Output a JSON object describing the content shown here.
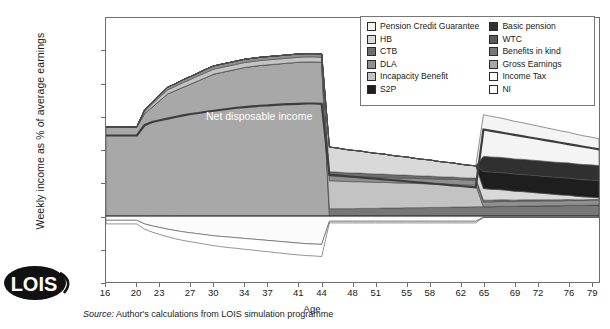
{
  "axes": {
    "ylabel": "Weekly income as % of average earnings",
    "xlabel": "Age",
    "yticks": [
      60,
      50,
      40,
      30,
      20,
      10,
      0,
      -10,
      -20
    ],
    "xticks": [
      16,
      20,
      23,
      27,
      30,
      34,
      37,
      41,
      44,
      48,
      51,
      55,
      58,
      62,
      65,
      69,
      72,
      76,
      79
    ]
  },
  "annotation": {
    "net_disposable_income": "Net disposable income"
  },
  "source": {
    "prefix": "Source:",
    "text": "Author's calculations from LOIS simulation programme"
  },
  "logo": {
    "text": "LOIS"
  },
  "legend": {
    "left": [
      {
        "label": "Pension Credit Guarantee",
        "color": "#f4f4f4"
      },
      {
        "label": "HB",
        "color": "#d9d9d9"
      },
      {
        "label": "CTB",
        "color": "#6e6e6e"
      },
      {
        "label": "DLA",
        "color": "#8f8f8f"
      },
      {
        "label": "Incapacity Benefit",
        "color": "#c3c3c3"
      },
      {
        "label": "S2P",
        "color": "#1e1e1e"
      }
    ],
    "right": [
      {
        "label": "Basic pension",
        "color": "#303030"
      },
      {
        "label": "WTC",
        "color": "#5a5a5a"
      },
      {
        "label": "Benefits in kind",
        "color": "#777777"
      },
      {
        "label": "Gross Earnings",
        "color": "#a8a8a8"
      },
      {
        "label": "Income Tax",
        "color": "#fbfbfb"
      },
      {
        "label": "NI",
        "color": "#ffffff"
      }
    ]
  },
  "chart_data": {
    "type": "area",
    "title": "",
    "xlabel": "Age",
    "ylabel": "Weekly income as % of average earnings",
    "xlim": [
      16,
      80
    ],
    "ylim": [
      -20,
      60
    ],
    "grid": false,
    "legend_position": "top-right",
    "x": [
      16,
      17,
      18,
      19,
      20,
      21,
      22,
      23,
      24,
      25,
      26,
      27,
      28,
      29,
      30,
      31,
      32,
      33,
      34,
      35,
      36,
      37,
      38,
      39,
      40,
      41,
      42,
      43,
      44,
      45,
      46,
      47,
      48,
      49,
      50,
      51,
      52,
      53,
      54,
      55,
      56,
      57,
      58,
      59,
      60,
      61,
      62,
      63,
      64,
      65,
      66,
      67,
      68,
      69,
      70,
      71,
      72,
      73,
      74,
      75,
      76,
      77,
      78,
      79,
      80
    ],
    "series": [
      {
        "name": "Gross Earnings",
        "color": "#a8a8a8",
        "values": [
          27,
          27,
          27,
          27,
          27,
          31,
          33,
          35,
          37,
          38,
          39,
          40,
          41,
          42,
          43,
          43.5,
          44,
          44.5,
          45,
          45.3,
          45.6,
          45.8,
          46,
          46.2,
          46.4,
          46.6,
          46.7,
          46.7,
          46.6,
          0,
          0,
          0,
          0,
          0,
          0,
          0,
          0,
          0,
          0,
          0,
          0,
          0,
          0,
          0,
          0,
          0,
          0,
          0,
          0,
          0,
          0,
          0,
          0,
          0,
          0,
          0,
          0,
          0,
          0,
          0,
          0,
          0,
          0,
          0,
          0
        ]
      },
      {
        "name": "Benefits in kind",
        "color": "#777777",
        "values": [
          0,
          0,
          0,
          0,
          0,
          0,
          0,
          0,
          0,
          0,
          0,
          0,
          0,
          0,
          0,
          0,
          0,
          0,
          0,
          0,
          0,
          0,
          0,
          0,
          0,
          0,
          0,
          0,
          0,
          2.2,
          2.2,
          2.2,
          2.2,
          2.3,
          2.3,
          2.3,
          2.4,
          2.4,
          2.4,
          2.5,
          2.5,
          2.5,
          2.6,
          2.6,
          2.6,
          2.7,
          2.7,
          2.7,
          2.8,
          2.8,
          2.8,
          2.9,
          2.9,
          2.9,
          3,
          3,
          3,
          3.1,
          3.1,
          3.1,
          3.2,
          3.2,
          3.2,
          3.3,
          3.3
        ]
      },
      {
        "name": "Incapacity Benefit",
        "color": "#c3c3c3",
        "values": [
          0,
          0,
          0,
          0,
          0,
          0.6,
          0.9,
          1.1,
          1.2,
          1.3,
          1.4,
          1.4,
          1.5,
          1.5,
          1.5,
          1.5,
          1.5,
          1.5,
          1.5,
          1.5,
          1.5,
          1.5,
          1.5,
          1.5,
          1.5,
          1.5,
          1.5,
          1.5,
          1.5,
          8.5,
          8.4,
          8.3,
          8.2,
          8.1,
          8,
          7.9,
          7.8,
          7.7,
          7.6,
          7.5,
          7.4,
          7.3,
          7.2,
          7.1,
          7,
          6.9,
          6.8,
          6.7,
          6.6,
          0,
          0,
          0,
          0,
          0,
          0,
          0,
          0,
          0,
          0,
          0,
          0,
          0,
          0,
          0,
          0
        ]
      },
      {
        "name": "DLA",
        "color": "#8f8f8f",
        "values": [
          0,
          0,
          0,
          0,
          0,
          0.5,
          0.6,
          0.7,
          0.8,
          0.8,
          0.9,
          0.9,
          0.9,
          1,
          1,
          1,
          1,
          1,
          1,
          1,
          1,
          1,
          1,
          1,
          1,
          1,
          1,
          1,
          1,
          1.5,
          1.5,
          1.5,
          1.5,
          1.5,
          1.5,
          1.5,
          1.5,
          1.5,
          1.5,
          1.5,
          1.5,
          1.5,
          1.5,
          1.5,
          1.5,
          1.5,
          1.5,
          1.5,
          1.5,
          1.5,
          1.5,
          1.5,
          1.5,
          1.5,
          1.5,
          1.5,
          1.5,
          1.5,
          1.5,
          1.5,
          1.5,
          1.5,
          1.5,
          1.5,
          1.5
        ]
      },
      {
        "name": "CTB",
        "color": "#6e6e6e",
        "values": [
          0,
          0,
          0,
          0,
          0,
          0,
          0,
          0,
          0,
          0,
          0,
          0,
          0,
          0,
          0,
          0,
          0,
          0,
          0,
          0,
          0,
          0,
          0,
          0,
          0,
          0,
          0,
          0,
          0,
          1.2,
          1.2,
          1.1,
          1.1,
          1.1,
          1,
          1,
          1,
          0.9,
          0.9,
          0.9,
          0.8,
          0.8,
          0.8,
          0.7,
          0.7,
          0.7,
          0.6,
          0.6,
          0.6,
          0.5,
          0.5,
          0.5,
          0.5,
          0.4,
          0.4,
          0.4,
          0.4,
          0.3,
          0.3,
          0.3,
          0.3,
          0.2,
          0.2,
          0.2,
          0.2
        ]
      },
      {
        "name": "HB",
        "color": "#d9d9d9",
        "values": [
          0,
          0,
          0,
          0,
          0,
          0,
          0,
          0,
          0,
          0,
          0,
          0,
          0,
          0,
          0,
          0,
          0,
          0,
          0,
          0,
          0,
          0,
          0,
          0,
          0,
          0,
          0,
          0,
          0,
          7.5,
          7.3,
          7.1,
          6.9,
          6.7,
          6.5,
          6.3,
          6.1,
          5.9,
          5.7,
          5.5,
          5.3,
          5.1,
          4.9,
          4.7,
          4.5,
          4.3,
          4.1,
          3.9,
          3.7,
          3.5,
          3.3,
          3.1,
          2.9,
          2.7,
          2.5,
          2.3,
          2.1,
          1.9,
          1.7,
          1.5,
          1.3,
          1.1,
          0.9,
          0.7,
          0.5
        ]
      },
      {
        "name": "S2P",
        "color": "#1e1e1e",
        "values": [
          0,
          0,
          0,
          0,
          0,
          0,
          0,
          0,
          0,
          0,
          0,
          0,
          0,
          0,
          0,
          0,
          0,
          0,
          0,
          0,
          0,
          0,
          0,
          0,
          0,
          0,
          0,
          0,
          0,
          0,
          0,
          0,
          0,
          0,
          0,
          0,
          0,
          0,
          0,
          0,
          0,
          0,
          0,
          0,
          0,
          0,
          0,
          0,
          0,
          5.2,
          5.2,
          5.2,
          5.2,
          5.2,
          5.2,
          5.2,
          5.2,
          5.2,
          5.2,
          5.2,
          5.2,
          5.2,
          5.2,
          5.2,
          5.2
        ]
      },
      {
        "name": "Basic pension",
        "color": "#303030",
        "values": [
          0,
          0,
          0,
          0,
          0,
          0,
          0,
          0,
          0,
          0,
          0,
          0,
          0,
          0,
          0,
          0,
          0,
          0,
          0,
          0,
          0,
          0,
          0,
          0,
          0,
          0,
          0,
          0,
          0,
          0,
          0,
          0,
          0,
          0,
          0,
          0,
          0,
          0,
          0,
          0,
          0,
          0,
          0,
          0,
          0,
          0,
          0,
          0,
          0,
          4.6,
          4.6,
          4.6,
          4.6,
          4.6,
          4.6,
          4.6,
          4.6,
          4.6,
          4.6,
          4.6,
          4.6,
          4.6,
          4.6,
          4.6,
          4.6
        ]
      },
      {
        "name": "WTC",
        "color": "#5a5a5a",
        "values": [
          0,
          0,
          0,
          0,
          0,
          0,
          0,
          0,
          0,
          0,
          0,
          0,
          0,
          0,
          0,
          0,
          0,
          0,
          0,
          0,
          0,
          0,
          0,
          0,
          0,
          0,
          0,
          0,
          0,
          0,
          0,
          0,
          0,
          0,
          0,
          0,
          0,
          0,
          0,
          0,
          0,
          0,
          0,
          0,
          0,
          0,
          0,
          0,
          0,
          0,
          0,
          0,
          0,
          0,
          0,
          0,
          0,
          0,
          0,
          0,
          0,
          0,
          0,
          0,
          0
        ]
      },
      {
        "name": "Pension Credit Guarantee",
        "color": "#f4f4f4",
        "values": [
          0,
          0,
          0,
          0,
          0,
          0,
          0,
          0,
          0,
          0,
          0,
          0,
          0,
          0,
          0,
          0,
          0,
          0,
          0,
          0,
          0,
          0,
          0,
          0,
          0,
          0,
          0,
          0,
          0,
          0,
          0,
          0,
          0,
          0,
          0,
          0,
          0,
          0,
          0,
          0,
          0,
          0,
          0,
          0,
          0,
          0,
          0,
          0,
          0,
          12.6,
          12.3,
          12,
          11.7,
          11.4,
          11.1,
          10.8,
          10.5,
          10.2,
          9.9,
          9.6,
          9.3,
          9,
          8.7,
          8.4,
          8.1
        ]
      },
      {
        "name": "Income Tax",
        "color": "#fbfbfb",
        "values": [
          -1.3,
          -1.3,
          -1.3,
          -1.3,
          -1.3,
          -2.4,
          -3,
          -3.5,
          -4,
          -4.4,
          -4.8,
          -5.1,
          -5.4,
          -5.7,
          -6,
          -6.2,
          -6.4,
          -6.6,
          -6.8,
          -7,
          -7.2,
          -7.4,
          -7.6,
          -7.8,
          -8,
          -8.2,
          -8.4,
          -8.5,
          -8.6,
          -1.6,
          -1.6,
          -1.6,
          -1.6,
          -1.6,
          -1.6,
          -1.6,
          -1.6,
          -1.6,
          -1.6,
          -1.6,
          -1.6,
          -1.6,
          -1.6,
          -1.6,
          -1.6,
          -1.6,
          -1.6,
          -1.6,
          -1.6,
          -0.4,
          -0.4,
          -0.4,
          -0.4,
          -0.4,
          -0.4,
          -0.4,
          -0.4,
          -0.4,
          -0.4,
          -0.4,
          -0.4,
          -0.4,
          -0.4,
          -0.4,
          -0.4
        ]
      },
      {
        "name": "NI",
        "color": "#ffffff",
        "values": [
          -1.1,
          -1.1,
          -1.1,
          -1.1,
          -1.1,
          -1.6,
          -1.9,
          -2.1,
          -2.3,
          -2.5,
          -2.6,
          -2.7,
          -2.8,
          -2.9,
          -3,
          -3.1,
          -3.2,
          -3.2,
          -3.3,
          -3.3,
          -3.4,
          -3.4,
          -3.5,
          -3.5,
          -3.6,
          -3.6,
          -3.6,
          -3.6,
          -3.7,
          -0.5,
          -0.5,
          -0.5,
          -0.5,
          -0.5,
          -0.5,
          -0.5,
          -0.5,
          -0.5,
          -0.5,
          -0.5,
          -0.5,
          -0.5,
          -0.5,
          -0.5,
          -0.5,
          -0.5,
          -0.5,
          -0.5,
          -0.5,
          0,
          0,
          0,
          0,
          0,
          0,
          0,
          0,
          0,
          0,
          0,
          0,
          0,
          0,
          0,
          0
        ]
      }
    ],
    "net_disposable_income": {
      "label": "Net disposable income",
      "values": [
        24.4,
        24.4,
        24.4,
        24.4,
        24.4,
        27.5,
        28.5,
        29,
        29.5,
        30,
        30.5,
        30.9,
        31.2,
        31.6,
        31.9,
        32.2,
        32.5,
        32.8,
        33,
        33.2,
        33.4,
        33.5,
        33.7,
        33.8,
        33.9,
        34,
        34.1,
        34.1,
        34,
        12.5,
        12.3,
        12.1,
        11.9,
        11.7,
        11.5,
        11.3,
        11.1,
        10.9,
        10.7,
        10.5,
        10.3,
        10.1,
        9.9,
        9.7,
        9.5,
        9.3,
        9.1,
        8.9,
        8.7,
        26.2,
        25.8,
        25.4,
        25,
        24.6,
        24.2,
        23.8,
        23.4,
        23,
        22.6,
        22.2,
        21.8,
        21.4,
        21,
        20.6,
        20.2
      ]
    }
  }
}
